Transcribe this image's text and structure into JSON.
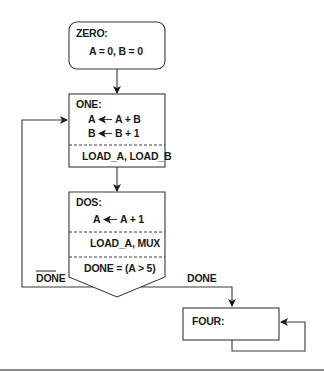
{
  "diagram": {
    "type": "ASM chart (state machine flowchart)",
    "states": {
      "zero": {
        "name": "ZERO:",
        "actions": [
          "A = 0, B = 0"
        ]
      },
      "one": {
        "name": "ONE:",
        "actions": [
          "A ← A + B",
          "B ← B + 1"
        ],
        "action_lhs": [
          "A",
          "B"
        ],
        "action_rhs": [
          "A + B",
          "B + 1"
        ],
        "signals": "LOAD_A, LOAD_B"
      },
      "dos": {
        "name": "DOS:",
        "actions": [
          "A ← A + 1"
        ],
        "action_lhs": [
          "A"
        ],
        "action_rhs": [
          "A + 1"
        ],
        "signals": "LOAD_A, MUX",
        "condition": "DONE = (A > 5)"
      },
      "four": {
        "name": "FOUR:"
      }
    },
    "transitions": [
      {
        "from": "ZERO",
        "to": "ONE",
        "label": ""
      },
      {
        "from": "ONE",
        "to": "DOS",
        "label": ""
      },
      {
        "from": "DOS",
        "to": "ONE",
        "label": "DONE",
        "negated": true
      },
      {
        "from": "DOS",
        "to": "FOUR",
        "label": "DONE",
        "negated": false
      },
      {
        "from": "FOUR",
        "to": "FOUR",
        "label": ""
      }
    ],
    "labels": {
      "not_done": "DONE",
      "done": "DONE"
    }
  }
}
